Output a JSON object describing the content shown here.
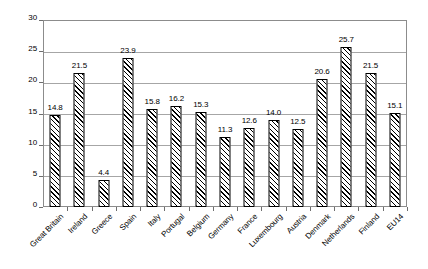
{
  "chart_data": {
    "type": "bar",
    "title": "",
    "subtitle": "",
    "xlabel": "",
    "ylabel": "",
    "ylim": [
      0,
      30
    ],
    "ytick_step": 5,
    "yticks": [
      "0",
      "5",
      "10",
      "15",
      "20",
      "25",
      "30"
    ],
    "grid": true,
    "legend": false,
    "legend_position": "none",
    "bar_style": "diagonal-hatch",
    "categories": [
      "Great Britain",
      "Ireland",
      "Greece",
      "Spain",
      "Italy",
      "Portugal",
      "Belgium",
      "Germany",
      "France",
      "Luxembourg",
      "Austria",
      "Denmark",
      "Netherlands",
      "Finland",
      "EU14"
    ],
    "values": [
      14.8,
      21.5,
      4.4,
      23.9,
      15.8,
      16.2,
      15.3,
      11.3,
      12.6,
      14.0,
      12.5,
      20.6,
      25.7,
      21.5,
      15.1
    ],
    "value_labels": [
      "14.8",
      "21.5",
      "4.4",
      "23.9",
      "15.8",
      "16.2",
      "15.3",
      "11.3",
      "12.6",
      "14.0",
      "12.5",
      "20.6",
      "25.7",
      "21.5",
      "15.1"
    ]
  },
  "colors": {
    "bar_outline": "#000000",
    "bar_fill": "#ffffff",
    "hatch": "#000000",
    "gridline": "#a6a6a6",
    "frame": "#8c8c8c",
    "text": "#000000",
    "background": "#ffffff"
  }
}
